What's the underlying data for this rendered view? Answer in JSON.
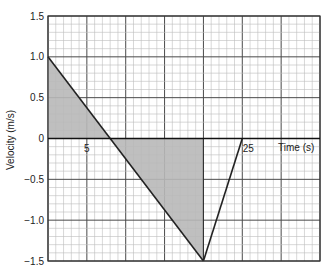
{
  "chart_data": {
    "type": "line",
    "title": "",
    "xlabel": "Time (s)",
    "ylabel": "Velocity (m/s)",
    "xlim": [
      0,
      35
    ],
    "ylim": [
      -1.5,
      1.5
    ],
    "grid": true,
    "x_tick_labels": [
      {
        "value": 5,
        "label": "5"
      },
      {
        "value": 25,
        "label": "25"
      }
    ],
    "y_tick_labels": [
      {
        "value": 1.5,
        "label": "1.5"
      },
      {
        "value": 1.0,
        "label": "1.0"
      },
      {
        "value": 0.5,
        "label": "0.5"
      },
      {
        "value": 0,
        "label": "0"
      },
      {
        "value": -0.5,
        "label": "−0.5"
      },
      {
        "value": -1.0,
        "label": "−1.0"
      },
      {
        "value": -1.5,
        "label": "−1.5"
      }
    ],
    "series": [
      {
        "name": "velocity",
        "points": [
          [
            0,
            1.0
          ],
          [
            20,
            -1.5
          ]
        ]
      },
      {
        "name": "pointer-to-25",
        "points": [
          [
            20,
            -1.5
          ],
          [
            25,
            0
          ]
        ]
      }
    ],
    "shaded_regions": [
      {
        "name": "positive-area",
        "points": [
          [
            0,
            0
          ],
          [
            0,
            1.0
          ],
          [
            8,
            0
          ]
        ]
      },
      {
        "name": "negative-area",
        "points": [
          [
            8,
            0
          ],
          [
            20,
            -1.5
          ],
          [
            20,
            0
          ]
        ]
      }
    ],
    "annotations": [
      {
        "text": "25",
        "x": 25,
        "y": 0
      }
    ],
    "colors": {
      "line": "#222222",
      "shade": "#b8b8b8",
      "grid_minor": "#bdbdbd",
      "grid_major": "#4a4a4a"
    }
  }
}
